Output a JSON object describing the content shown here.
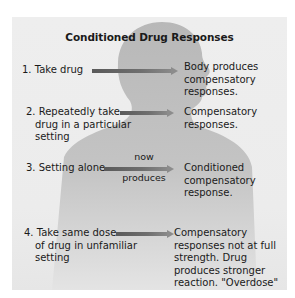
{
  "title": "Conditioned Drug Responses",
  "colors": {
    "panel_background": "#ececec",
    "silhouette": "#b9b9b9",
    "arrow_dark": "#5a5a5a",
    "arrow_light": "#8c8c8c",
    "text": "#1a1a1a"
  },
  "icons": {
    "silhouette": "human-head-silhouette-icon",
    "arrow": "right-arrow-icon"
  },
  "steps": [
    {
      "cause_lines": [
        "1. Take drug"
      ],
      "arrow_label_above": "",
      "arrow_label_below": "",
      "effect_lines": [
        "Body produces",
        "compensatory",
        "responses."
      ]
    },
    {
      "cause_lines": [
        "2. Repeatedly take",
        "drug in a particular",
        "setting"
      ],
      "arrow_label_above": "",
      "arrow_label_below": "",
      "effect_lines": [
        "Compensatory",
        "responses."
      ]
    },
    {
      "cause_lines": [
        "3. Setting alone"
      ],
      "arrow_label_above": "now",
      "arrow_label_below": "produces",
      "effect_lines": [
        "Conditioned",
        "compensatory",
        "response."
      ]
    },
    {
      "cause_lines": [
        "4. Take same dose",
        "of drug in unfamiliar",
        "setting"
      ],
      "arrow_label_above": "",
      "arrow_label_below": "",
      "effect_lines": [
        "Compensatory",
        "responses not at full",
        "strength. Drug",
        "produces stronger",
        "reaction. \"Overdose\"",
        "more likely."
      ]
    }
  ]
}
